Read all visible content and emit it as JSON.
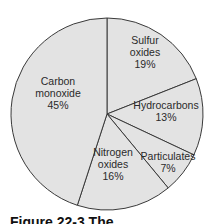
{
  "chart_data": {
    "type": "pie",
    "title": "",
    "start_angle_deg": 0,
    "direction": "clockwise",
    "fill_color": "#e3e3e3",
    "stroke_color": "#3a3a3a",
    "slices": [
      {
        "label": "Sulfur oxides",
        "lines": [
          "Sulfur",
          "oxides",
          "19%"
        ],
        "value": 19
      },
      {
        "label": "Hydrocarbons",
        "lines": [
          "Hydrocarbons",
          "13%"
        ],
        "value": 13
      },
      {
        "label": "Particulates",
        "lines": [
          "Particulates",
          "7%"
        ],
        "value": 7
      },
      {
        "label": "Nitrogen oxides",
        "lines": [
          "Nitrogen",
          "oxides",
          "16%"
        ],
        "value": 16
      },
      {
        "label": "Carbon monoxide",
        "lines": [
          "Carbon",
          "monoxide",
          "45%"
        ],
        "value": 45
      }
    ],
    "categories": [
      "Sulfur oxides",
      "Hydrocarbons",
      "Particulates",
      "Nitrogen oxides",
      "Carbon monoxide"
    ],
    "values": [
      19,
      13,
      7,
      16,
      45
    ],
    "unit": "%"
  },
  "caption": {
    "text": "Figure 22-3  The ..."
  }
}
